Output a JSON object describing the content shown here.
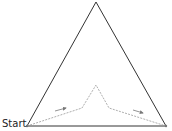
{
  "diagram": {
    "start_label": "Start",
    "colors": {
      "triangle": "#333333",
      "path": "#999999",
      "arrow": "#777777"
    },
    "triangle_points": "96,2 27,126 166,126",
    "path_points": "27,126 82,108 96,85 109,108 166,126",
    "arrows": [
      {
        "x1": 55,
        "y1": 111,
        "x2": 66,
        "y2": 108
      },
      {
        "x1": 133,
        "y1": 110,
        "x2": 143,
        "y2": 113
      }
    ]
  }
}
